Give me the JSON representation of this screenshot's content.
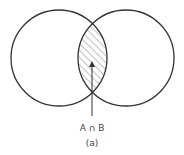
{
  "diagram": {
    "type": "venn",
    "sets": [
      {
        "name": "A",
        "cx": 59,
        "cy": 58,
        "r": 48
      },
      {
        "name": "B",
        "cx": 126,
        "cy": 58,
        "r": 48
      }
    ],
    "highlight": "intersection",
    "arrow_label": "A ∩ B",
    "caption": "(a)",
    "colors": {
      "stroke": "#333333",
      "hatch": "#777777",
      "background": "#ffffff"
    }
  }
}
